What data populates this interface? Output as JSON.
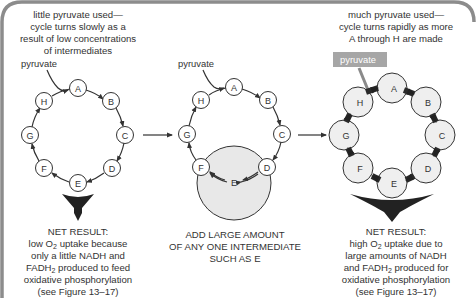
{
  "figure": {
    "panels": [
      {
        "id": "low",
        "top_caption": [
          "little pyruvate used—",
          "cycle turns slowly as a",
          "result of low concentrations",
          "of intermediates"
        ],
        "pyruvate_label": "pyruvate",
        "intermediates": [
          "A",
          "B",
          "C",
          "D",
          "E",
          "F",
          "G",
          "H"
        ],
        "net_result": {
          "heading": "NET RESULT:",
          "line1_pre": "low O",
          "line1_sub": "2",
          "line1_post": " uptake because",
          "line2": "only a little NADH and",
          "line3_pre": "FADH",
          "line3_sub": "2",
          "line3_post": " produced to feed",
          "line4": "oxidative phosphorylation",
          "line5": "(see Figure 13–17)"
        }
      },
      {
        "id": "add",
        "pyruvate_label": "pyruvate",
        "intermediates": [
          "A",
          "B",
          "C",
          "D",
          "E",
          "F",
          "G",
          "H"
        ],
        "bottom_caption": [
          "ADD LARGE AMOUNT",
          "OF ANY ONE INTERMEDIATE",
          "SUCH AS E"
        ]
      },
      {
        "id": "high",
        "top_caption": [
          "much pyruvate used—",
          "cycle turns rapidly as more",
          "A through H are made"
        ],
        "pyruvate_label": "pyruvate",
        "intermediates": [
          "A",
          "B",
          "C",
          "D",
          "E",
          "F",
          "G",
          "H"
        ],
        "net_result": {
          "heading": "NET RESULT:",
          "line1_pre": "high O",
          "line1_sub": "2",
          "line1_post": " uptake due to",
          "line2": "large amounts of NADH",
          "line3_pre": "and FADH",
          "line3_sub": "2",
          "line3_post": " produced for",
          "line4": "oxidative phosphorylation",
          "line5": "(see Figure 13–17)"
        }
      }
    ],
    "colors": {
      "frame": "#8c8c8c",
      "ink": "#333333",
      "arrow_dark": "#2a2a2a",
      "circle_fill_light": "#ececec",
      "pyruvate_box": "#a6a6a6"
    }
  }
}
